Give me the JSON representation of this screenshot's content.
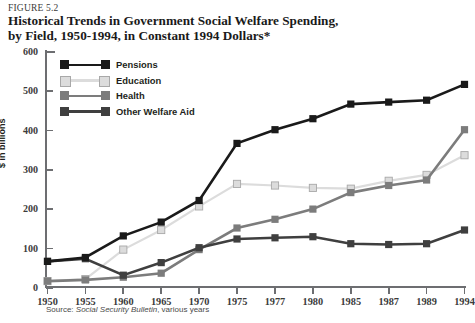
{
  "figure": {
    "label": "FIGURE 5.2",
    "title_line1": "Historical Trends in Government Social Welfare Spending,",
    "title_line2": "by Field, 1950-1994, in Constant 1994 Dollars*"
  },
  "source": {
    "prefix": "Source: ",
    "italic": "Social Security Bulletin",
    "suffix": ", various years"
  },
  "legend": {
    "position": "inside-top-left",
    "items": [
      {
        "label": "Pensions",
        "color": "#1a1a1a"
      },
      {
        "label": "Education",
        "color": "#dcdcdc"
      },
      {
        "label": "Health",
        "color": "#7c7c7c"
      },
      {
        "label": "Other Welfare Aid",
        "color": "#3f3f3f"
      }
    ]
  },
  "chart_data": {
    "type": "line",
    "title": "Historical Trends in Government Social Welfare Spending, by Field, 1950-1994, in Constant 1994 Dollars*",
    "xlabel": "",
    "ylabel": "$ in billions",
    "categories": [
      "1950",
      "1955",
      "1960",
      "1965",
      "1970",
      "1975",
      "1977",
      "1980",
      "1985",
      "1987",
      "1989",
      "1994"
    ],
    "ylim": [
      0,
      600
    ],
    "yticks": [
      0,
      100,
      200,
      300,
      400,
      500,
      600
    ],
    "grid": false,
    "series": [
      {
        "name": "Pensions",
        "color": "#1a1a1a",
        "values": [
          65,
          75,
          130,
          165,
          220,
          365,
          400,
          428,
          465,
          470,
          475,
          515
        ]
      },
      {
        "name": "Education",
        "color": "#dcdcdc",
        "values": [
          15,
          20,
          95,
          145,
          205,
          262,
          258,
          252,
          250,
          270,
          285,
          335
        ]
      },
      {
        "name": "Health",
        "color": "#7c7c7c",
        "values": [
          15,
          18,
          25,
          35,
          95,
          150,
          172,
          198,
          240,
          258,
          272,
          400
        ]
      },
      {
        "name": "Other Welfare Aid",
        "color": "#3f3f3f",
        "values": [
          65,
          72,
          30,
          62,
          100,
          122,
          125,
          128,
          110,
          108,
          110,
          145
        ]
      }
    ]
  }
}
